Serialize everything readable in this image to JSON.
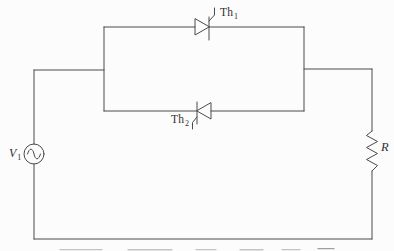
{
  "diagram": {
    "kind": "circuit-schematic",
    "colors": {
      "ink": "#4a4a4a",
      "background": "#fcfcfc",
      "label": "#2f2f2f",
      "remnant": "#c4c4c4"
    },
    "components": {
      "th1": {
        "symbol": "thyristor-right",
        "label_base": "Th",
        "label_sub": "1"
      },
      "th2": {
        "symbol": "thyristor-left",
        "label_base": "Th",
        "label_sub": "2"
      },
      "source": {
        "symbol": "ac-voltage-source",
        "label_base": "V",
        "label_sub": "1"
      },
      "load": {
        "symbol": "resistor",
        "label": "R"
      }
    }
  }
}
